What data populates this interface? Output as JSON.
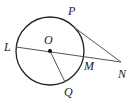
{
  "figure": {
    "type": "geometry-circle-tangent-secant",
    "colors": {
      "stroke": "#222222",
      "line": "#555555"
    },
    "circle": {
      "center_label": "O",
      "cx": 50,
      "cy": 51,
      "r": 34
    },
    "points": {
      "L": {
        "label": "L",
        "x": 16,
        "y": 47
      },
      "O": {
        "label": "O",
        "x": 50,
        "y": 51
      },
      "M": {
        "label": "M",
        "x": 84,
        "y": 56
      },
      "N": {
        "label": "N",
        "x": 121,
        "y": 62
      },
      "P": {
        "label": "P",
        "x": 75,
        "y": 28
      },
      "Q": {
        "label": "Q",
        "x": 65,
        "y": 82
      }
    },
    "segments": [
      {
        "name": "secant-LN",
        "from": "L",
        "to": "N"
      },
      {
        "name": "tangent-PN",
        "from": "P",
        "to": "N"
      },
      {
        "name": "radius-OQ",
        "from": "O",
        "to": "Q"
      }
    ]
  }
}
